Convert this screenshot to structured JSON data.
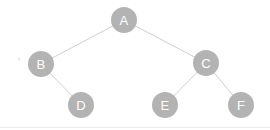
{
  "diagram": {
    "type": "binary-tree",
    "width": 270,
    "height": 130,
    "background_color": "#ffffff",
    "node": {
      "radius": 13,
      "fill_color": "#b3b3b3",
      "label_color": "#ffffff",
      "label_font_size": 13
    },
    "edge": {
      "stroke_color": "#cfcfcf",
      "stroke_width": 1
    },
    "decorations": {
      "bottom_rule": {
        "color": "#ededed",
        "y": 127
      },
      "speck": {
        "color": "#d8d8d8",
        "x": 18,
        "y": 58
      }
    },
    "nodes": [
      {
        "id": "A",
        "label": "A",
        "x": 124,
        "y": 20,
        "depth": 0,
        "role": "root"
      },
      {
        "id": "B",
        "label": "B",
        "x": 41,
        "y": 64,
        "depth": 1,
        "role": "left-child"
      },
      {
        "id": "C",
        "label": "C",
        "x": 206,
        "y": 63,
        "depth": 1,
        "role": "right-child"
      },
      {
        "id": "D",
        "label": "D",
        "x": 81,
        "y": 105,
        "depth": 2,
        "role": "right-child"
      },
      {
        "id": "E",
        "label": "E",
        "x": 165,
        "y": 105,
        "depth": 2,
        "role": "left-child"
      },
      {
        "id": "F",
        "label": "F",
        "x": 241,
        "y": 105,
        "depth": 2,
        "role": "right-child"
      }
    ],
    "edges": [
      {
        "from": "A",
        "to": "B",
        "x1": 124,
        "y1": 20,
        "x2": 41,
        "y2": 64
      },
      {
        "from": "A",
        "to": "C",
        "x1": 124,
        "y1": 20,
        "x2": 206,
        "y2": 63
      },
      {
        "from": "B",
        "to": "D",
        "x1": 41,
        "y1": 64,
        "x2": 81,
        "y2": 105
      },
      {
        "from": "C",
        "to": "E",
        "x1": 206,
        "y1": 63,
        "x2": 165,
        "y2": 105
      },
      {
        "from": "C",
        "to": "F",
        "x1": 206,
        "y1": 63,
        "x2": 241,
        "y2": 105
      }
    ]
  }
}
